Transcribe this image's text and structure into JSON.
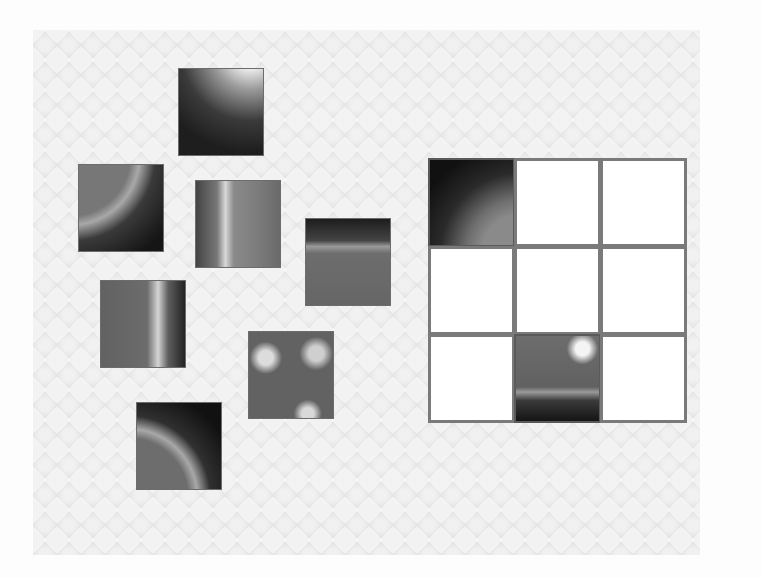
{
  "game": {
    "type": "image-puzzle",
    "subject": "solar imagery",
    "grid": {
      "rows": 3,
      "cols": 3
    },
    "loose_pieces": [
      {
        "id": "p1",
        "texture": "corner-tr",
        "x": 178,
        "y": 68
      },
      {
        "id": "p2",
        "texture": "limb-tl",
        "x": 78,
        "y": 164
      },
      {
        "id": "p3",
        "texture": "surface-flare",
        "x": 195,
        "y": 180
      },
      {
        "id": "p4",
        "texture": "limb-top",
        "x": 305,
        "y": 218
      },
      {
        "id": "p5",
        "texture": "limb-right",
        "x": 100,
        "y": 280
      },
      {
        "id": "p6",
        "texture": "surface-active",
        "x": 248,
        "y": 331
      },
      {
        "id": "p7",
        "texture": "limb-bl",
        "x": 136,
        "y": 402
      }
    ],
    "cells": [
      {
        "row": 0,
        "col": 0,
        "filled": true,
        "texture": "placed-tl"
      },
      {
        "row": 0,
        "col": 1,
        "filled": false
      },
      {
        "row": 0,
        "col": 2,
        "filled": false
      },
      {
        "row": 1,
        "col": 0,
        "filled": false
      },
      {
        "row": 1,
        "col": 1,
        "filled": false
      },
      {
        "row": 1,
        "col": 2,
        "filled": false
      },
      {
        "row": 2,
        "col": 0,
        "filled": false
      },
      {
        "row": 2,
        "col": 1,
        "filled": true,
        "texture": "placed-bc"
      },
      {
        "row": 2,
        "col": 2,
        "filled": false
      }
    ],
    "placed_count": 2,
    "total_pieces": 9
  },
  "colors": {
    "board_bg": "#e9e9e9",
    "cell_border": "#7a7a7a",
    "cell_empty": "#ffffff"
  }
}
